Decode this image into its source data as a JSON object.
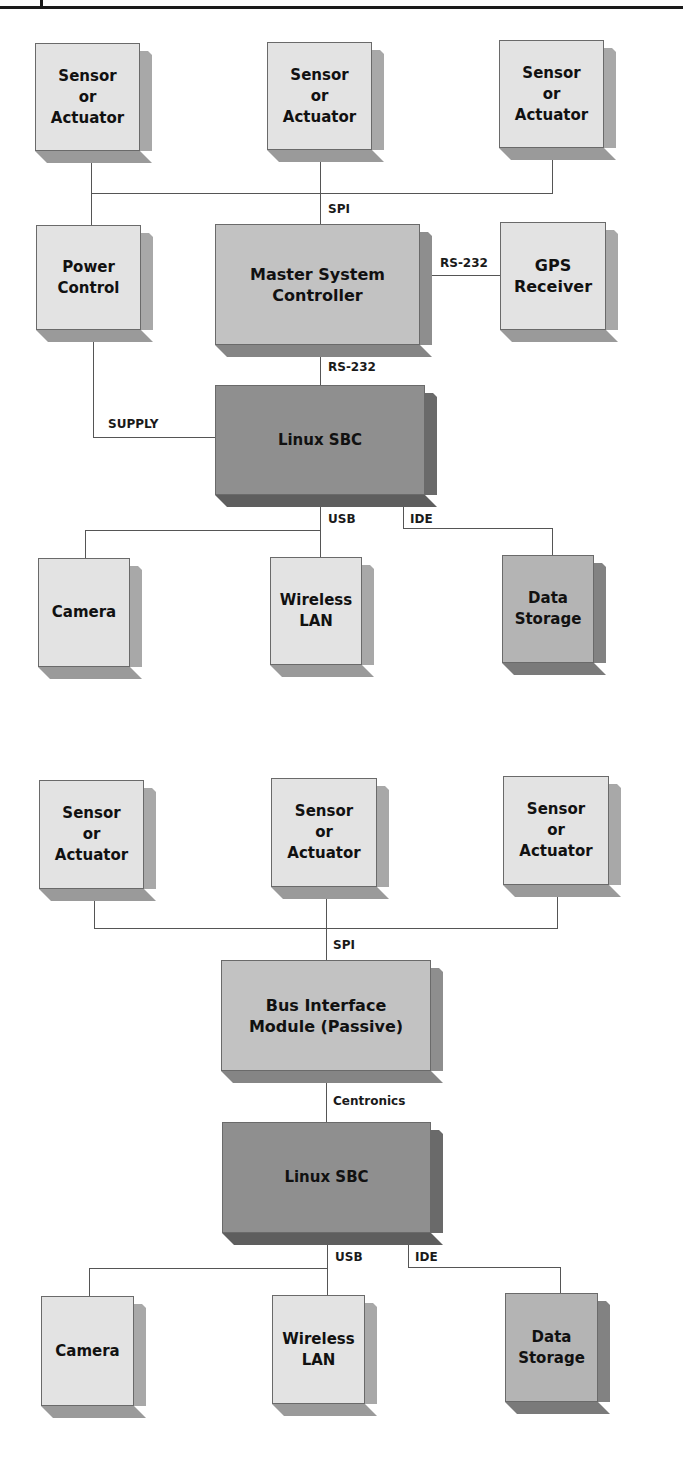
{
  "diagrams": [
    {
      "name": "active-controller-architecture",
      "nodes": {
        "sensor_1": "Sensor\nor\nActuator",
        "sensor_2": "Sensor\nor\nActuator",
        "sensor_3": "Sensor\nor\nActuator",
        "power_control": "Power\nControl",
        "master_controller": "Master System\nController",
        "gps_receiver": "GPS\nReceiver",
        "linux_sbc": "Linux SBC",
        "camera": "Camera",
        "wireless_lan": "Wireless\nLAN",
        "data_storage": "Data\nStorage"
      },
      "links": {
        "spi": "SPI",
        "rs232_gps": "RS-232",
        "rs232_sbc": "RS-232",
        "supply": "SUPPLY",
        "usb": "USB",
        "ide": "IDE"
      }
    },
    {
      "name": "passive-bus-architecture",
      "nodes": {
        "sensor_1": "Sensor\nor\nActuator",
        "sensor_2": "Sensor\nor\nActuator",
        "sensor_3": "Sensor\nor\nActuator",
        "bus_interface": "Bus Interface\nModule (Passive)",
        "linux_sbc": "Linux SBC",
        "camera": "Camera",
        "wireless_lan": "Wireless\nLAN",
        "data_storage": "Data\nStorage"
      },
      "links": {
        "spi": "SPI",
        "centronics": "Centronics",
        "usb": "USB",
        "ide": "IDE"
      }
    }
  ],
  "colors": {
    "light_box": "#e3e3e3",
    "mid_box": "#c2c2c2",
    "dark_box": "#8f8f8f",
    "line": "#555555"
  }
}
